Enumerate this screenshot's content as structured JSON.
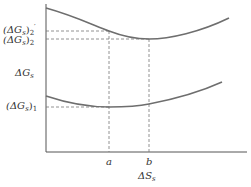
{
  "diagram": {
    "x_axis_label": "ΔS",
    "x_axis_label_sub": "s",
    "y_axis_label": "ΔG",
    "y_axis_label_sub": "s",
    "x_ticks": [
      {
        "label": "a"
      },
      {
        "label": "b"
      }
    ],
    "y_levels": [
      {
        "label_main": "(ΔG",
        "label_sub": "s",
        "label_close": ")",
        "label_index": "2",
        "label_prime": "′"
      },
      {
        "label_main": "(ΔG",
        "label_sub": "s",
        "label_close": ")",
        "label_index": "2"
      },
      {
        "label_main": "(ΔG",
        "label_sub": "s",
        "label_close": ")",
        "label_index": "1"
      }
    ],
    "curves": [
      {
        "name": "upper-curve",
        "minimum_at": "b"
      },
      {
        "name": "lower-curve",
        "minimum_at": "a"
      }
    ],
    "colors": {
      "curve": "#6e6e6e",
      "axis": "#555555",
      "dashed": "#777777",
      "text": "#333333"
    }
  }
}
